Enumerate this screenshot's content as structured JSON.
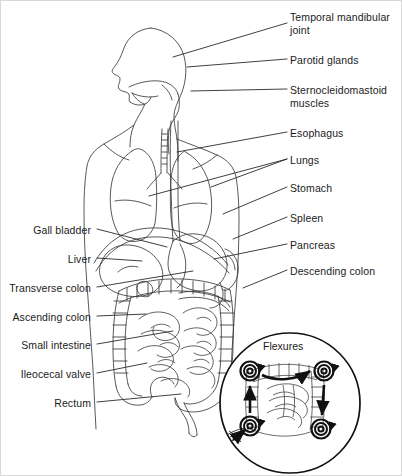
{
  "figure": {
    "style": "line-art medical illustration",
    "background_color": "#ffffff",
    "line_color": "#3a3a3a",
    "text_color": "#1b1b1b",
    "width": 402,
    "height": 476
  },
  "labels_right": [
    {
      "id": "temporal-mandibular-joint",
      "text": "Temporal mandibular\njoint",
      "x": 289,
      "y": 10,
      "leader": {
        "x1": 286,
        "y1": 22,
        "x2": 172,
        "y2": 56
      }
    },
    {
      "id": "parotid-glands",
      "text": "Parotid glands",
      "x": 289,
      "y": 53,
      "leader": {
        "x1": 286,
        "y1": 58,
        "x2": 186,
        "y2": 66
      }
    },
    {
      "id": "sternocleidomastoid-muscles",
      "text": "Sternocleidomastoid\nmuscles",
      "x": 289,
      "y": 83,
      "leader": {
        "x1": 286,
        "y1": 88,
        "x2": 190,
        "y2": 90
      }
    },
    {
      "id": "esophagus",
      "text": "Esophagus",
      "x": 289,
      "y": 126,
      "leader": {
        "x1": 286,
        "y1": 131,
        "x2": 176,
        "y2": 151
      }
    },
    {
      "id": "lungs",
      "text": "Lungs",
      "x": 289,
      "y": 153,
      "leader": {
        "x1": 286,
        "y1": 158,
        "x2": 210,
        "y2": 186
      }
    },
    {
      "id": "lungs-2",
      "text": "",
      "x": 0,
      "y": 0,
      "leader": {
        "x1": 286,
        "y1": 158,
        "x2": 148,
        "y2": 195
      }
    },
    {
      "id": "stomach",
      "text": "Stomach",
      "x": 289,
      "y": 181,
      "leader": {
        "x1": 286,
        "y1": 186,
        "x2": 222,
        "y2": 213
      }
    },
    {
      "id": "spleen",
      "text": "Spleen",
      "x": 289,
      "y": 211,
      "leader": {
        "x1": 286,
        "y1": 216,
        "x2": 232,
        "y2": 238
      }
    },
    {
      "id": "pancreas",
      "text": "Pancreas",
      "x": 289,
      "y": 238,
      "leader": {
        "x1": 286,
        "y1": 243,
        "x2": 213,
        "y2": 258
      }
    },
    {
      "id": "descending-colon",
      "text": "Descending colon",
      "x": 289,
      "y": 264,
      "leader": {
        "x1": 286,
        "y1": 269,
        "x2": 242,
        "y2": 287
      }
    }
  ],
  "labels_left": [
    {
      "id": "gall-bladder",
      "text": "Gall bladder",
      "x": 90,
      "y": 223,
      "leader": {
        "x1": 96,
        "y1": 228,
        "x2": 166,
        "y2": 246
      }
    },
    {
      "id": "liver",
      "text": "Liver",
      "x": 90,
      "y": 252,
      "leader": {
        "x1": 96,
        "y1": 257,
        "x2": 141,
        "y2": 260
      }
    },
    {
      "id": "transverse-colon",
      "text": "Transverse colon",
      "x": 90,
      "y": 281,
      "leader": {
        "x1": 96,
        "y1": 286,
        "x2": 192,
        "y2": 270
      }
    },
    {
      "id": "ascending-colon",
      "text": "Ascending colon",
      "x": 90,
      "y": 310,
      "leader": {
        "x1": 96,
        "y1": 315,
        "x2": 145,
        "y2": 313
      }
    },
    {
      "id": "small-intestine",
      "text": "Small intestine",
      "x": 90,
      "y": 338,
      "leader": {
        "x1": 96,
        "y1": 343,
        "x2": 172,
        "y2": 330
      }
    },
    {
      "id": "ileocecal-valve",
      "text": "Ileocecal valve",
      "x": 90,
      "y": 367,
      "leader": {
        "x1": 96,
        "y1": 372,
        "x2": 146,
        "y2": 362
      }
    },
    {
      "id": "rectum",
      "text": "Rectum",
      "x": 90,
      "y": 396,
      "leader": {
        "x1": 96,
        "y1": 401,
        "x2": 180,
        "y2": 393
      }
    }
  ],
  "inset": {
    "title": "Flexures",
    "title_x": 262,
    "title_y": 345,
    "center_x": 289,
    "center_y": 402,
    "radius": 71,
    "markers": [
      {
        "id": "hepatic-flexure-marker",
        "cx": 249,
        "cy": 370
      },
      {
        "id": "splenic-flexure-marker",
        "cx": 323,
        "cy": 370
      },
      {
        "id": "ileocecal-marker",
        "cx": 249,
        "cy": 425
      },
      {
        "id": "sigmoid-marker",
        "cx": 320,
        "cy": 428
      }
    ],
    "arrows": [
      {
        "id": "arrow-across-top",
        "from": [
          262,
          372
        ],
        "to": [
          312,
          368
        ]
      },
      {
        "id": "arrow-up-left",
        "from": [
          249,
          412
        ],
        "to": [
          249,
          382
        ]
      },
      {
        "id": "arrow-down-right",
        "from": [
          322,
          382
        ],
        "to": [
          320,
          416
        ]
      },
      {
        "id": "arrow-into-cecum",
        "from": [
          232,
          438
        ],
        "to": [
          245,
          428
        ]
      }
    ]
  }
}
